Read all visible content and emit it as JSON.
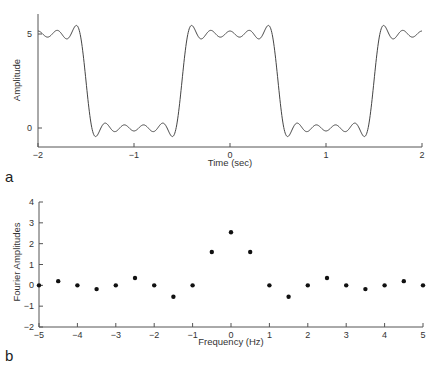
{
  "chart_data": [
    {
      "panel": "a",
      "type": "line",
      "title": "",
      "xlabel": "Time (sec)",
      "ylabel": "Amplitude",
      "xlim": [
        -2,
        2
      ],
      "ylim": [
        -1,
        6
      ],
      "xticks": [
        -2,
        -1,
        0,
        1,
        2
      ],
      "xtick_labels": [
        "-2",
        "-1",
        "0",
        "1",
        "2"
      ],
      "yticks": [
        0,
        5
      ],
      "ytick_labels": [
        "0",
        "5"
      ],
      "grid": false,
      "series": [
        {
          "name": "Square wave (Fourier partial sum, harmonics up to 4.5 Hz)",
          "description": "Square wave with period 2 s, high level 5 for |t| < 0.5 (mod 2), low level 0 otherwise, showing Gibbs ringing",
          "dc": 2.5,
          "period": 2,
          "high": 5,
          "low": 0
        }
      ]
    },
    {
      "panel": "b",
      "type": "scatter",
      "title": "",
      "xlabel": "Frequency (Hz)",
      "ylabel": "Fourier Amplitudes",
      "xlim": [
        -5,
        5
      ],
      "ylim": [
        -2,
        4
      ],
      "xticks": [
        -5,
        -4,
        -3,
        -2,
        -1,
        0,
        1,
        2,
        3,
        4,
        5
      ],
      "xtick_labels": [
        "-5",
        "-4",
        "-3",
        "-2",
        "-1",
        "0",
        "1",
        "2",
        "3",
        "4",
        "5"
      ],
      "yticks": [
        -2,
        -1,
        0,
        1,
        2,
        3,
        4
      ],
      "ytick_labels": [
        "-2",
        "-1",
        "0",
        "1",
        "2",
        "3",
        "4"
      ],
      "grid": false,
      "x": [
        -5,
        -4.5,
        -4,
        -3.5,
        -3,
        -2.5,
        -2,
        -1.5,
        -1,
        -0.5,
        0,
        0.5,
        1,
        1.5,
        2,
        2.5,
        3,
        3.5,
        4,
        4.5,
        5
      ],
      "series": [
        {
          "name": "Fourier coefficients",
          "values": [
            0,
            0.2,
            0,
            -0.18,
            0,
            0.35,
            0,
            -0.55,
            0,
            1.6,
            2.55,
            1.6,
            0,
            -0.55,
            0,
            0.35,
            0,
            -0.18,
            0,
            0.2,
            0
          ]
        }
      ]
    }
  ],
  "panels": {
    "a": {
      "label": "a"
    },
    "b": {
      "label": "b"
    }
  }
}
